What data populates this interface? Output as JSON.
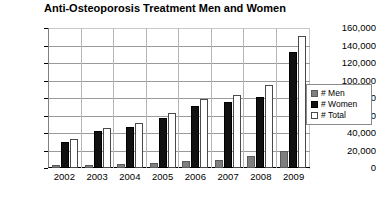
{
  "chart_data": {
    "type": "bar",
    "title": "Anti-Osteoporosis Treatment Men and Women",
    "xlabel": "",
    "ylabel": "",
    "ylim": [
      0,
      160000
    ],
    "ytick_step": 20000,
    "grid": true,
    "legend_position": "right",
    "categories": [
      "2002",
      "2003",
      "2004",
      "2005",
      "2006",
      "2007",
      "2008",
      "2009"
    ],
    "ytick_labels": [
      "160,000",
      "140,000",
      "120,000",
      "100,000",
      "80,000",
      "60,000",
      "40,000",
      "20,000",
      "0"
    ],
    "ytick_values": [
      160000,
      140000,
      120000,
      100000,
      80000,
      60000,
      40000,
      20000,
      0
    ],
    "series": [
      {
        "name": "# Men",
        "color": "#7f7f7f",
        "values": [
          3000,
          4000,
          4500,
          6000,
          8000,
          9000,
          14000,
          19000
        ]
      },
      {
        "name": "# Women",
        "color": "#111111",
        "values": [
          30000,
          42000,
          47000,
          57000,
          71000,
          75000,
          81000,
          133000
        ]
      },
      {
        "name": "# Total",
        "color": "#ffffff",
        "values": [
          33000,
          46000,
          51500,
          63000,
          79000,
          84000,
          95000,
          151000
        ]
      }
    ]
  },
  "legend": {
    "items": [
      {
        "label": "# Men",
        "key": "men"
      },
      {
        "label": "# Women",
        "key": "women"
      },
      {
        "label": "# Total",
        "key": "total"
      }
    ]
  },
  "colors": {
    "men": "#7f7f7f",
    "women": "#111111",
    "total": "#ffffff",
    "axis": "#000000",
    "grid": "#9a9a9a",
    "background": "#ffffff"
  }
}
